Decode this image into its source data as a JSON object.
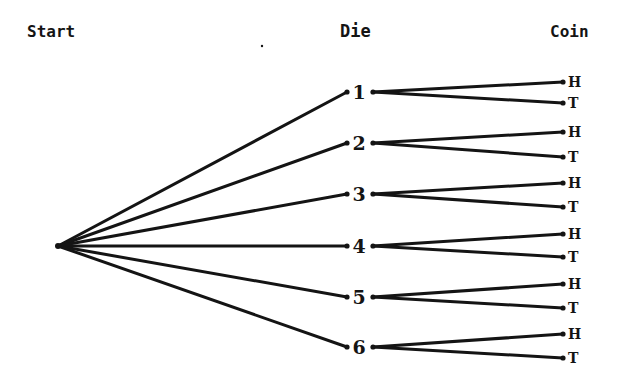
{
  "headers": {
    "start": "Start",
    "die": "Die",
    "coin": "Coin"
  },
  "colors": {
    "ink": "#141414",
    "background": "#ffffff"
  },
  "start_node": {
    "x": 58,
    "y": 246
  },
  "die_nodes": [
    {
      "label": "1",
      "y": 92,
      "leaves": [
        {
          "label": "H",
          "y": 82
        },
        {
          "label": "T",
          "y": 103
        }
      ]
    },
    {
      "label": "2",
      "y": 143,
      "leaves": [
        {
          "label": "H",
          "y": 132
        },
        {
          "label": "T",
          "y": 157
        }
      ]
    },
    {
      "label": "3",
      "y": 194,
      "leaves": [
        {
          "label": "H",
          "y": 183
        },
        {
          "label": "T",
          "y": 207
        }
      ]
    },
    {
      "label": "4",
      "y": 246,
      "leaves": [
        {
          "label": "H",
          "y": 234
        },
        {
          "label": "T",
          "y": 257
        }
      ]
    },
    {
      "label": "5",
      "y": 297,
      "leaves": [
        {
          "label": "H",
          "y": 284
        },
        {
          "label": "T",
          "y": 308
        }
      ]
    },
    {
      "label": "6",
      "y": 347,
      "leaves": [
        {
          "label": "H",
          "y": 334
        },
        {
          "label": "T",
          "y": 358
        }
      ]
    }
  ]
}
